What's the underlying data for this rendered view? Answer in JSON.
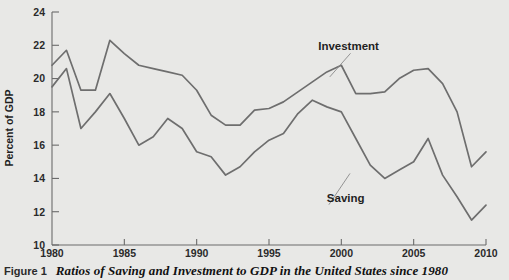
{
  "caption": {
    "figure_number": "Figure 1",
    "title": "Ratios of Saving and Investment to GDP in the United States since 1980"
  },
  "chart_data": {
    "type": "line",
    "title": "Ratios of Saving and Investment to GDP in the United States since 1980",
    "xlabel": "",
    "ylabel": "Percent of GDP",
    "xlim": [
      1980,
      2010
    ],
    "ylim": [
      10,
      24
    ],
    "grid": false,
    "legend_position": "inline-annotation",
    "x_ticks": [
      1980,
      1985,
      1990,
      1995,
      2000,
      2005,
      2010
    ],
    "x_tick_labels": [
      "1980",
      "1985",
      "1990",
      "1995",
      "2000",
      "2005",
      "2010"
    ],
    "y_ticks": [
      10,
      12,
      14,
      16,
      18,
      20,
      22,
      24
    ],
    "y_tick_labels": [
      "10",
      "12",
      "14",
      "16",
      "18",
      "20",
      "22",
      "24"
    ],
    "x": [
      1980,
      1981,
      1982,
      1983,
      1984,
      1985,
      1986,
      1987,
      1988,
      1989,
      1990,
      1991,
      1992,
      1993,
      1994,
      1995,
      1996,
      1997,
      1998,
      1999,
      2000,
      2001,
      2002,
      2003,
      2004,
      2005,
      2006,
      2007,
      2008,
      2009,
      2010
    ],
    "series": [
      {
        "name": "Investment",
        "color": "#6e6e6e",
        "values": [
          20.8,
          21.7,
          19.3,
          19.3,
          22.3,
          21.5,
          20.8,
          20.6,
          20.4,
          20.2,
          19.3,
          17.8,
          17.2,
          17.2,
          18.1,
          18.2,
          18.6,
          19.2,
          19.8,
          20.4,
          20.8,
          19.1,
          19.1,
          19.2,
          20.0,
          20.5,
          20.6,
          19.7,
          18.0,
          14.7,
          15.6
        ]
      },
      {
        "name": "Saving",
        "color": "#6e6e6e",
        "values": [
          19.5,
          20.6,
          17.0,
          18.0,
          19.1,
          17.6,
          16.0,
          16.5,
          17.6,
          17.0,
          15.6,
          15.3,
          14.2,
          14.7,
          15.6,
          16.3,
          16.7,
          17.9,
          18.7,
          18.3,
          18.0,
          16.4,
          14.8,
          14.0,
          14.5,
          15.0,
          16.4,
          14.2,
          12.9,
          11.5,
          12.4
        ]
      }
    ],
    "annotations": [
      {
        "text": "Investment",
        "x": 2000.5,
        "y": 21.7,
        "points_to_x": 1999.2,
        "points_to_y": 20.1
      },
      {
        "text": "Saving",
        "x": 1999.0,
        "y": 12.6,
        "points_to_x": 2000.6,
        "points_to_y": 14.3
      }
    ]
  }
}
